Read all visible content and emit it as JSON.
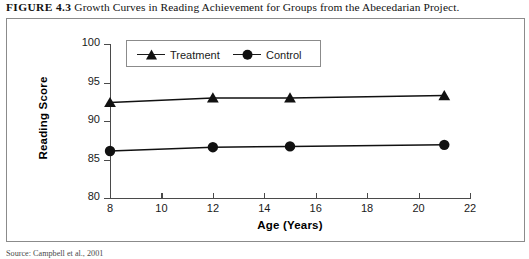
{
  "caption": {
    "figure_number": "FIGURE 4.3",
    "text": "Growth Curves in Reading Achievement for Groups from the Abecedarian Project."
  },
  "source_note": "Source: Campbell et al., 2001",
  "legend": {
    "position": "top-center-inside",
    "entries": [
      {
        "label": "Treatment",
        "marker": "triangle-marker",
        "color": "#111111"
      },
      {
        "label": "Control",
        "marker": "circle-marker",
        "color": "#111111"
      }
    ]
  },
  "axes": {
    "x_title": "Age (Years)",
    "y_title": "Reading Score",
    "x_ticks": [
      "8",
      "10",
      "12",
      "14",
      "16",
      "18",
      "20",
      "22"
    ],
    "y_ticks": [
      "80",
      "85",
      "90",
      "95",
      "100"
    ]
  },
  "chart_data": {
    "type": "line",
    "title": "Growth Curves in Reading Achievement for Groups from the Abecedarian Project.",
    "xlabel": "Age (Years)",
    "ylabel": "Reading Score",
    "xlim": [
      8,
      22
    ],
    "ylim": [
      80,
      100
    ],
    "xticks": [
      8,
      10,
      12,
      14,
      16,
      18,
      20,
      22
    ],
    "yticks": [
      80,
      85,
      90,
      95,
      100
    ],
    "grid": false,
    "legend_position": "upper center",
    "x": [
      8,
      12,
      15,
      21
    ],
    "series": [
      {
        "name": "Treatment",
        "marker": "triangle",
        "color": "#111111",
        "values": [
          92.4,
          93.0,
          93.0,
          93.3
        ]
      },
      {
        "name": "Control",
        "marker": "circle",
        "color": "#111111",
        "values": [
          86.1,
          86.6,
          86.7,
          86.9
        ]
      }
    ]
  }
}
